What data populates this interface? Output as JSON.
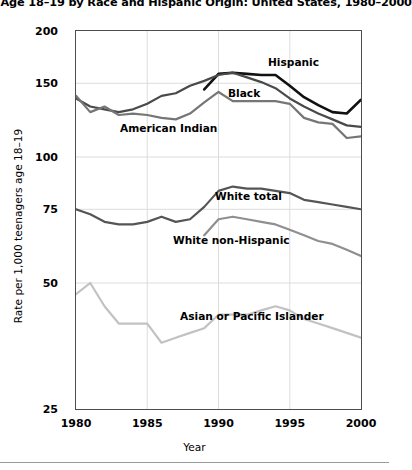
{
  "chart_data": {
    "type": "line",
    "title": "ers Age 18–19 by Race and Hispanic Origin: United States, 1980–2000",
    "xlabel": "Year",
    "ylabel": "Rate per 1,000 teenagers age 18–19",
    "xlim": [
      1980,
      2000
    ],
    "ylim": [
      25,
      200
    ],
    "yscale": "log",
    "grid": true,
    "legend_position": "inline-annotations",
    "xticks": [
      1980,
      1985,
      1990,
      1995,
      2000
    ],
    "xtick_labels": [
      "1980",
      "1985",
      "1990",
      "1995",
      "2000"
    ],
    "yticks": [
      25,
      50,
      75,
      100,
      150,
      200
    ],
    "ytick_labels": [
      "25",
      "50",
      "75",
      "100",
      "150",
      "200"
    ],
    "x": [
      1980,
      1981,
      1982,
      1983,
      1984,
      1985,
      1986,
      1987,
      1988,
      1989,
      1990,
      1991,
      1992,
      1993,
      1994,
      1995,
      1996,
      1997,
      1998,
      1999,
      2000
    ],
    "series": [
      {
        "name": "Hispanic",
        "color": "#111111",
        "width": 2.6,
        "x": [
          1989,
          1990,
          1991,
          1992,
          1993,
          1994,
          1995,
          1996,
          1997,
          1998,
          1999,
          2000
        ],
        "values": [
          145,
          158,
          159,
          158,
          157,
          157,
          148,
          139,
          133,
          128,
          127,
          137
        ]
      },
      {
        "name": "Black",
        "color": "#4a4a4a",
        "width": 2.2,
        "x": [
          1980,
          1981,
          1982,
          1983,
          1984,
          1985,
          1986,
          1987,
          1988,
          1989,
          1990,
          1991,
          1992,
          1993,
          1994,
          1995,
          1996,
          1997,
          1998,
          1999,
          2000
        ],
        "values": [
          138,
          132,
          130,
          128,
          130,
          134,
          140,
          142,
          148,
          152,
          157,
          159,
          155,
          151,
          146,
          138,
          132,
          127,
          123,
          119,
          118
        ]
      },
      {
        "name": "American Indian",
        "color": "#767676",
        "width": 2.2,
        "x": [
          1980,
          1981,
          1982,
          1983,
          1984,
          1985,
          1986,
          1987,
          1988,
          1989,
          1990,
          1991,
          1992,
          1993,
          1994,
          1995,
          1996,
          1997,
          1998,
          1999,
          2000
        ],
        "values": [
          140,
          128,
          132,
          126,
          127,
          126,
          124,
          123,
          127,
          135,
          143,
          136,
          136,
          136,
          136,
          134,
          124,
          121,
          120,
          111,
          112
        ]
      },
      {
        "name": "White total",
        "color": "#555555",
        "width": 2.2,
        "x": [
          1980,
          1981,
          1982,
          1983,
          1984,
          1985,
          1986,
          1987,
          1988,
          1989,
          1990,
          1991,
          1992,
          1993,
          1994,
          1995,
          1996,
          1997,
          1998,
          1999,
          2000
        ],
        "values": [
          75,
          73,
          70,
          69,
          69,
          70,
          72,
          70,
          71,
          76,
          83,
          85,
          84,
          84,
          83,
          82,
          79,
          78,
          77,
          76,
          75
        ]
      },
      {
        "name": "White non-Hispanic",
        "color": "#8f8f8f",
        "width": 2.2,
        "x": [
          1989,
          1990,
          1991,
          1992,
          1993,
          1994,
          1995,
          1996,
          1997,
          1998,
          1999,
          2000
        ],
        "values": [
          65,
          71,
          72,
          71,
          70,
          69,
          67,
          65,
          63,
          62,
          60,
          58
        ]
      },
      {
        "name": "Asian or Pacific Islander",
        "color": "#c2c2c2",
        "width": 2.2,
        "x": [
          1980,
          1981,
          1982,
          1983,
          1984,
          1985,
          1986,
          1987,
          1988,
          1989,
          1990,
          1991,
          1992,
          1993,
          1994,
          1995,
          1996,
          1997,
          1998,
          1999,
          2000
        ],
        "values": [
          47,
          50,
          44,
          40,
          40,
          40,
          36,
          37,
          38,
          39,
          42,
          42,
          42,
          43,
          44,
          43,
          41,
          40,
          39,
          38,
          37
        ]
      }
    ],
    "annotations": [
      {
        "text": "Hispanic",
        "x": 268,
        "y": 56
      },
      {
        "text": "Black",
        "x": 228,
        "y": 87
      },
      {
        "text": "American Indian",
        "x": 120,
        "y": 122
      },
      {
        "text": "White total",
        "x": 215,
        "y": 190
      },
      {
        "text": "White non-Hispanic",
        "x": 173,
        "y": 234
      },
      {
        "text": "Asian or Pacific Islander",
        "x": 180,
        "y": 310
      }
    ]
  }
}
